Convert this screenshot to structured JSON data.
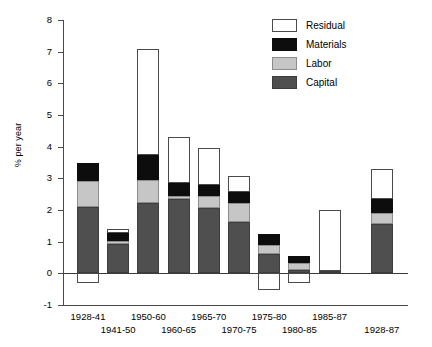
{
  "chart_data": {
    "type": "bar",
    "subtype": "stacked-bar-with-negatives",
    "title": "",
    "xlabel": "",
    "ylabel": "% per year",
    "ylim": [
      -1,
      8
    ],
    "yticks": [
      8,
      7,
      6,
      5,
      4,
      3,
      2,
      1,
      0,
      -1
    ],
    "ytick_labels": [
      "8",
      "7",
      "6",
      "5",
      "4",
      "3",
      "2",
      "1",
      "0",
      "-1"
    ],
    "grid": false,
    "legend_position": "top-right",
    "legend": [
      "Residual",
      "Materials",
      "Labor",
      "Capital"
    ],
    "colors": {
      "Residual": "#ffffff",
      "Materials": "#0d0d0d",
      "Labor": "#c6c6c6",
      "Capital": "#4f4f4f",
      "axis": "#4a4a4a"
    },
    "categories": [
      "1928-41",
      "1941-50",
      "1950-60",
      "1960-65",
      "1965-70",
      "1970-75",
      "1975-80",
      "1980-85",
      "1985-87",
      "1928-87"
    ],
    "series": [
      {
        "name": "Capital",
        "values": [
          2.09,
          0.92,
          2.21,
          2.34,
          2.06,
          1.61,
          0.6,
          0.1,
          0.08,
          1.55
        ]
      },
      {
        "name": "Labor",
        "values": [
          0.82,
          0.09,
          0.73,
          0.1,
          0.38,
          0.6,
          0.29,
          0.22,
          0.0,
          0.35
        ]
      },
      {
        "name": "Materials",
        "values": [
          0.57,
          0.25,
          0.79,
          0.41,
          0.34,
          0.35,
          0.34,
          0.22,
          0.0,
          0.44
        ]
      },
      {
        "name": "Residual",
        "values": [
          -0.32,
          0.13,
          3.36,
          1.45,
          1.18,
          0.51,
          -0.54,
          -0.31,
          1.91,
          0.95
        ]
      }
    ],
    "totals": [
      3.48,
      1.39,
      7.09,
      4.3,
      3.96,
      3.07,
      1.23,
      0.54,
      1.99,
      3.29
    ]
  },
  "legend": {
    "items": [
      {
        "label": "Residual",
        "key": "residual"
      },
      {
        "label": "Materials",
        "key": "materials"
      },
      {
        "label": "Labor",
        "key": "labor"
      },
      {
        "label": "Capital",
        "key": "capital"
      }
    ]
  },
  "axes": {
    "y_title": "% per year",
    "y_tick_labels": [
      "8",
      "7",
      "6",
      "5",
      "4",
      "3",
      "2",
      "1",
      "0",
      "-1"
    ],
    "x_tick_labels": [
      "1928-41",
      "1941-50",
      "1950-60",
      "1960-65",
      "1965-70",
      "1970-75",
      "1975-80",
      "1980-85",
      "1985-87",
      "1928-87"
    ]
  }
}
